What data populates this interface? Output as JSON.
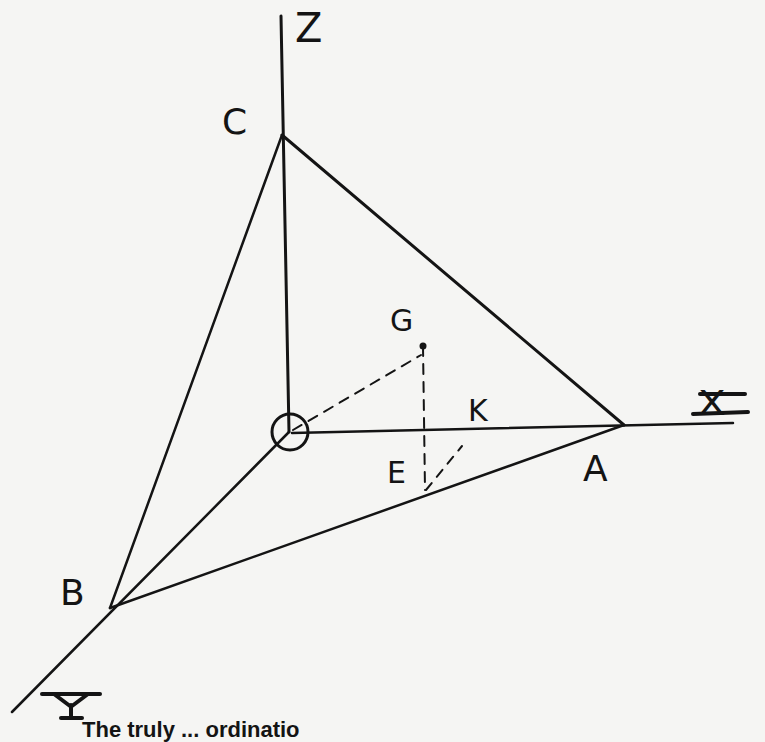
{
  "diagram": {
    "axes": {
      "x": "X",
      "y": "Y",
      "z": "Z"
    },
    "points": {
      "origin": "O",
      "a": "A",
      "b": "B",
      "c": "C",
      "g": "G",
      "e": "E",
      "k": "K"
    },
    "colors": {
      "ink": "#141414",
      "paper": "#f5f5f3"
    }
  },
  "caption": {
    "text": "The truly ... ordinatio"
  }
}
